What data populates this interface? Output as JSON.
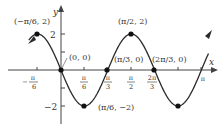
{
  "chart_data": {
    "type": "line",
    "title": "",
    "function": "y = -2 sin(3x)",
    "xlabel": "x",
    "ylabel": "y",
    "xlim": [
      -1.0,
      3.3
    ],
    "ylim": [
      -2.6,
      2.6
    ],
    "x_ticks": [
      "-π/6",
      "π/6",
      "π/3",
      "π/2",
      "2π/3",
      "π"
    ],
    "y_ticks": [
      "2",
      "-2"
    ],
    "labeled_points": [
      {
        "label": "(−π/6, 2)",
        "x": -0.5236,
        "y": 2
      },
      {
        "label": "(0, 0)",
        "x": 0,
        "y": 0
      },
      {
        "label": "(π/6, −2)",
        "x": 0.5236,
        "y": -2
      },
      {
        "label": "(π/3, 0)",
        "x": 1.0472,
        "y": 0
      },
      {
        "label": "(π/2, 2)",
        "x": 1.5708,
        "y": 2
      },
      {
        "label": "(2π/3, 0)",
        "x": 2.0944,
        "y": 0
      }
    ],
    "unlabeled_points": [
      {
        "x": 2.618,
        "y": -2
      }
    ],
    "grid": false,
    "legend": null
  },
  "labels": {
    "x_axis": "x",
    "y_axis": "y",
    "ytick_pos": "2",
    "ytick_neg": "−2",
    "pt_neg_pi6": "(−π/6, 2)",
    "pt_origin": "(0, 0)",
    "pt_pi6": "(π/6, −2)",
    "pt_pi3": "(π/3, 0)",
    "pt_pi2": "(π/2, 2)",
    "pt_2pi3": "(2π/3, 0)"
  },
  "colors": {
    "curve": "#2a2a2a",
    "axis": "#444444",
    "text": "#333333"
  }
}
